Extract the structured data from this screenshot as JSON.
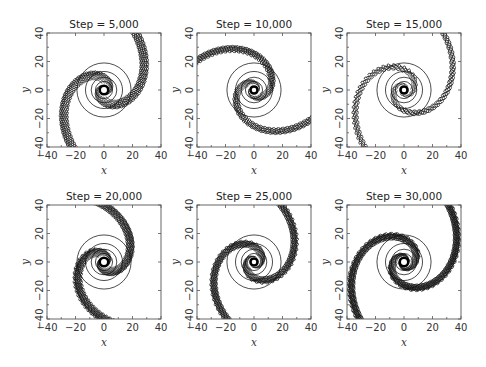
{
  "chart_data": [
    {
      "type": "contour",
      "title": "Step = 5,000",
      "xlabel": "x",
      "ylabel": "y",
      "xlim": [
        -40,
        40
      ],
      "ylim": [
        -40,
        40
      ],
      "xticks": [
        -40,
        -20,
        0,
        20,
        40
      ],
      "yticks": [
        -40,
        -20,
        0,
        20,
        40
      ],
      "pattern": {
        "arms": 2,
        "winding": 1.6,
        "arm_width": 9,
        "levels": 9,
        "core_radius": 3,
        "phase": 0.3
      }
    },
    {
      "type": "contour",
      "title": "Step = 10,000",
      "xlabel": "x",
      "ylabel": "y",
      "xlim": [
        -40,
        40
      ],
      "ylim": [
        -40,
        40
      ],
      "xticks": [
        -40,
        -20,
        0,
        20,
        40
      ],
      "yticks": [
        -40,
        -20,
        0,
        20,
        40
      ],
      "pattern": {
        "arms": 2,
        "winding": 1.9,
        "arm_width": 8,
        "levels": 8,
        "core_radius": 2.5,
        "phase": 1.2
      }
    },
    {
      "type": "contour",
      "title": "Step = 15,000",
      "xlabel": "x",
      "ylabel": "y",
      "xlim": [
        -40,
        40
      ],
      "ylim": [
        -40,
        40
      ],
      "xticks": [
        -40,
        -20,
        0,
        20,
        40
      ],
      "yticks": [
        -40,
        -20,
        0,
        20,
        40
      ],
      "pattern": {
        "arms": 2,
        "winding": 2.1,
        "arm_width": 7,
        "levels": 5,
        "core_radius": 2.5,
        "phase": 2.0
      }
    },
    {
      "type": "contour",
      "title": "Step = 20,000",
      "xlabel": "x",
      "ylabel": "y",
      "xlim": [
        -40,
        40
      ],
      "ylim": [
        -40,
        40
      ],
      "xticks": [
        -40,
        -20,
        0,
        20,
        40
      ],
      "yticks": [
        -40,
        -20,
        0,
        20,
        40
      ],
      "pattern": {
        "arms": 2,
        "winding": 1.7,
        "arm_width": 9,
        "levels": 12,
        "core_radius": 3,
        "phase": 0.8
      }
    },
    {
      "type": "contour",
      "title": "Step = 25,000",
      "xlabel": "x",
      "ylabel": "y",
      "xlim": [
        -40,
        40
      ],
      "ylim": [
        -40,
        40
      ],
      "xticks": [
        -40,
        -20,
        0,
        20,
        40
      ],
      "yticks": [
        -40,
        -20,
        0,
        20,
        40
      ],
      "pattern": {
        "arms": 2,
        "winding": 2.0,
        "arm_width": 9,
        "levels": 11,
        "core_radius": 2.5,
        "phase": 2.6
      }
    },
    {
      "type": "contour",
      "title": "Step = 30,000",
      "xlabel": "x",
      "ylabel": "y",
      "xlim": [
        -40,
        40
      ],
      "ylim": [
        -40,
        40
      ],
      "xticks": [
        -40,
        -20,
        0,
        20,
        40
      ],
      "yticks": [
        -40,
        -20,
        0,
        20,
        40
      ],
      "pattern": {
        "arms": 2,
        "winding": 2.2,
        "arm_width": 10,
        "levels": 13,
        "core_radius": 3,
        "phase": 1.6
      }
    }
  ]
}
